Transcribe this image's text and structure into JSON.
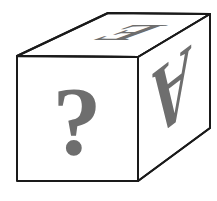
{
  "figure": {
    "colors": {
      "background": "#ffffff",
      "edge": "#1a1a1a",
      "face_fill": "#ffffff",
      "glyph": "#6e6e6e"
    }
  },
  "cube": {
    "faces": {
      "front": {
        "label": "?",
        "orientation": "upright"
      },
      "right": {
        "label": "A",
        "orientation": "upside-down"
      },
      "top": {
        "label": "E",
        "orientation": "rotated"
      }
    }
  }
}
